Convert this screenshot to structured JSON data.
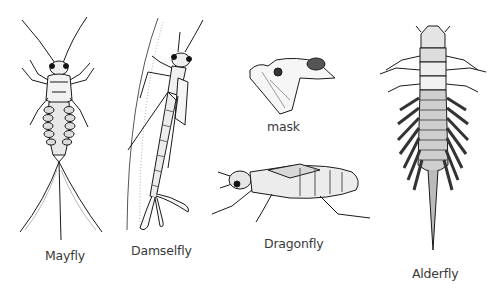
{
  "figure": {
    "title": "",
    "background": "#ffffff",
    "ink_color": "#1a1a1a",
    "labels": {
      "mayfly": "Mayfly",
      "damselfly": "Damselfly",
      "mask": "mask",
      "dragonfly": "Dragonfly",
      "alderfly": "Alderfly"
    },
    "specimens": [
      {
        "id": "mayfly",
        "label": "Mayfly",
        "depiction": "mayfly nymph, dorsal view, three tails"
      },
      {
        "id": "damselfly",
        "label": "Damselfly",
        "depiction": "damselfly nymph climbing plant stem, three leaf-like gills"
      },
      {
        "id": "mask",
        "label": "mask",
        "depiction": "extended labial mask of dragonfly nymph"
      },
      {
        "id": "dragonfly",
        "label": "Dragonfly",
        "depiction": "dragonfly nymph, lateral view"
      },
      {
        "id": "alderfly",
        "label": "Alderfly",
        "depiction": "alderfly larva, dorsal view, lateral filaments, single tail"
      }
    ]
  }
}
